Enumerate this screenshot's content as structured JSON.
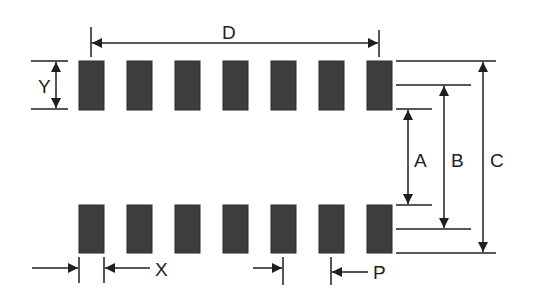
{
  "diagram": {
    "type": "SMD footprint land pattern (dual row)",
    "colors": {
      "pad": "#3d3d3d",
      "line": "#1f1f1f",
      "background": "#ffffff"
    },
    "rows": 2,
    "pads_per_row": 7,
    "labels": {
      "D": "D",
      "Y": "Y",
      "A": "A",
      "B": "B",
      "C": "C",
      "X": "X",
      "P": "P"
    },
    "dimensions": [
      {
        "label": "D",
        "meaning": "span from first pad to last pad",
        "orientation": "horizontal"
      },
      {
        "label": "Y",
        "meaning": "pad length",
        "orientation": "vertical"
      },
      {
        "label": "A",
        "meaning": "inner gap between rows",
        "orientation": "vertical"
      },
      {
        "label": "B",
        "meaning": "center-to-center between rows",
        "orientation": "vertical"
      },
      {
        "label": "C",
        "meaning": "outer span across rows",
        "orientation": "vertical"
      },
      {
        "label": "X",
        "meaning": "pad width",
        "orientation": "horizontal"
      },
      {
        "label": "P",
        "meaning": "pad pitch",
        "orientation": "horizontal"
      }
    ]
  }
}
